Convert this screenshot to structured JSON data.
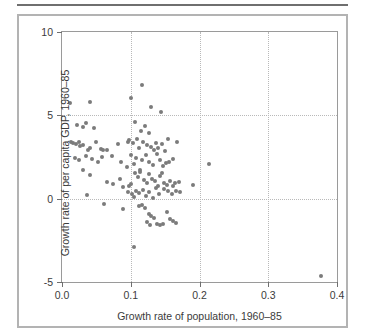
{
  "chart_data": {
    "type": "scatter",
    "title": "",
    "xlabel": "Growth rate of population, 1960–85",
    "ylabel": "Growth rate of per capita GDP, 1960–85",
    "xlim": [
      0.0,
      0.4
    ],
    "ylim": [
      -5,
      10
    ],
    "xticks": [
      0.0,
      0.1,
      0.2,
      0.3,
      0.4
    ],
    "xticklabels": [
      "0.0",
      "0.1",
      "0.2",
      "0.3",
      "0.4"
    ],
    "yticks": [
      -5,
      0,
      5,
      10
    ],
    "yticklabels": [
      "-5",
      "0",
      "5",
      "10"
    ],
    "grid": true,
    "gridlines_x": [
      0.1,
      0.2,
      0.3
    ],
    "gridlines_y": [
      0,
      5
    ],
    "legend": null,
    "marker_color": "#7b7b7b",
    "marker_size_px": 4,
    "points": [
      [
        0.012,
        5.72
      ],
      [
        0.04,
        5.78
      ],
      [
        0.101,
        6.05
      ],
      [
        0.117,
        6.82
      ],
      [
        0.13,
        5.48
      ],
      [
        0.144,
        5.18
      ],
      [
        0.022,
        4.4
      ],
      [
        0.031,
        4.29
      ],
      [
        0.035,
        4.52
      ],
      [
        0.047,
        4.22
      ],
      [
        0.106,
        4.62
      ],
      [
        0.115,
        4.05
      ],
      [
        0.12,
        4.38
      ],
      [
        0.126,
        3.96
      ],
      [
        0.013,
        3.38
      ],
      [
        0.016,
        3.36
      ],
      [
        0.02,
        3.3
      ],
      [
        0.024,
        3.4
      ],
      [
        0.026,
        3.18
      ],
      [
        0.03,
        3.22
      ],
      [
        0.038,
        2.92
      ],
      [
        0.041,
        3.04
      ],
      [
        0.049,
        3.4
      ],
      [
        0.057,
        3.0
      ],
      [
        0.06,
        2.92
      ],
      [
        0.066,
        2.94
      ],
      [
        0.082,
        3.26
      ],
      [
        0.096,
        3.38
      ],
      [
        0.098,
        3.52
      ],
      [
        0.103,
        3.32
      ],
      [
        0.109,
        3.58
      ],
      [
        0.112,
        3.06
      ],
      [
        0.118,
        3.4
      ],
      [
        0.124,
        3.24
      ],
      [
        0.13,
        3.1
      ],
      [
        0.134,
        2.95
      ],
      [
        0.136,
        3.34
      ],
      [
        0.14,
        3.02
      ],
      [
        0.146,
        3.28
      ],
      [
        0.15,
        2.86
      ],
      [
        0.154,
        3.56
      ],
      [
        0.167,
        3.42
      ],
      [
        0.019,
        2.46
      ],
      [
        0.025,
        2.3
      ],
      [
        0.035,
        2.56
      ],
      [
        0.044,
        2.4
      ],
      [
        0.052,
        2.18
      ],
      [
        0.058,
        2.48
      ],
      [
        0.072,
        2.54
      ],
      [
        0.086,
        2.2
      ],
      [
        0.094,
        1.92
      ],
      [
        0.1,
        2.62
      ],
      [
        0.104,
        2.08
      ],
      [
        0.108,
        2.44
      ],
      [
        0.113,
        1.72
      ],
      [
        0.116,
        2.3
      ],
      [
        0.122,
        2.6
      ],
      [
        0.127,
        2.22
      ],
      [
        0.133,
        2.02
      ],
      [
        0.138,
        2.68
      ],
      [
        0.142,
        2.34
      ],
      [
        0.147,
        1.98
      ],
      [
        0.151,
        2.14
      ],
      [
        0.156,
        2.22
      ],
      [
        0.162,
        2.4
      ],
      [
        0.214,
        2.1
      ],
      [
        0.03,
        1.74
      ],
      [
        0.041,
        1.4
      ],
      [
        0.066,
        1.02
      ],
      [
        0.074,
        0.9
      ],
      [
        0.084,
        1.16
      ],
      [
        0.089,
        0.68
      ],
      [
        0.098,
        0.74
      ],
      [
        0.101,
        0.86
      ],
      [
        0.106,
        1.52
      ],
      [
        0.11,
        1.28
      ],
      [
        0.114,
        1.6
      ],
      [
        0.119,
        1.1
      ],
      [
        0.123,
        0.92
      ],
      [
        0.126,
        1.46
      ],
      [
        0.131,
        1.18
      ],
      [
        0.135,
        1.04
      ],
      [
        0.139,
        0.78
      ],
      [
        0.143,
        1.34
      ],
      [
        0.145,
        1.56
      ],
      [
        0.148,
        0.96
      ],
      [
        0.152,
        0.84
      ],
      [
        0.157,
        1.08
      ],
      [
        0.161,
        0.76
      ],
      [
        0.165,
        0.92
      ],
      [
        0.17,
        1.02
      ],
      [
        0.19,
        0.82
      ],
      [
        0.036,
        0.22
      ],
      [
        0.061,
        -0.3
      ],
      [
        0.096,
        0.38
      ],
      [
        0.102,
        0.3
      ],
      [
        0.105,
        0.12
      ],
      [
        0.108,
        0.48
      ],
      [
        0.112,
        0.34
      ],
      [
        0.118,
        0.52
      ],
      [
        0.122,
        0.18
      ],
      [
        0.127,
        0.42
      ],
      [
        0.132,
        0.04
      ],
      [
        0.137,
        0.62
      ],
      [
        0.141,
        0.26
      ],
      [
        0.149,
        0.56
      ],
      [
        0.154,
        0.44
      ],
      [
        0.16,
        0.3
      ],
      [
        0.166,
        0.46
      ],
      [
        0.172,
        0.38
      ],
      [
        0.088,
        -0.62
      ],
      [
        0.112,
        -0.44
      ],
      [
        0.117,
        -0.38
      ],
      [
        0.121,
        -0.54
      ],
      [
        0.126,
        -0.92
      ],
      [
        0.13,
        -1.06
      ],
      [
        0.134,
        -1.18
      ],
      [
        0.138,
        -1.52
      ],
      [
        0.142,
        -1.58
      ],
      [
        0.147,
        -1.54
      ],
      [
        0.128,
        -1.6
      ],
      [
        0.123,
        -1.42
      ],
      [
        0.152,
        -0.82
      ],
      [
        0.157,
        -1.24
      ],
      [
        0.161,
        -1.34
      ],
      [
        0.166,
        -1.48
      ],
      [
        0.104,
        -2.88
      ],
      [
        0.377,
        -4.62
      ]
    ]
  },
  "axis": {
    "x_title": "Growth rate of population, 1960–85",
    "y_title": "Growth rate of per capita GDP, 1960–85"
  }
}
